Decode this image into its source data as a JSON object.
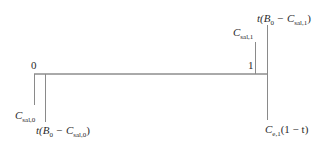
{
  "diagram": {
    "type": "timeline",
    "axis": {
      "start_label": "0",
      "end_label": "1"
    },
    "labels": {
      "c_sal_0": {
        "main": "C",
        "sub": "sal,0"
      },
      "t_b0_c_sal_0": {
        "prefix": "t(B",
        "b_sub": "0",
        "middle": " − C",
        "c_sub": "sal,0",
        "suffix": ")"
      },
      "c_sal_1": {
        "main": "C",
        "sub": "sal,1"
      },
      "t_b0_c_sal_1": {
        "prefix": "t(B",
        "b_sub": "0",
        "middle": " − C",
        "c_sub": "sal,1",
        "suffix": ")"
      },
      "c_e1_1_minus_t": {
        "main": "C",
        "sub": "e,1",
        "suffix": "(1 − t)"
      }
    },
    "colors": {
      "line": "#8a8a8a",
      "axis": "#555555",
      "text": "#2a2a2a"
    }
  }
}
